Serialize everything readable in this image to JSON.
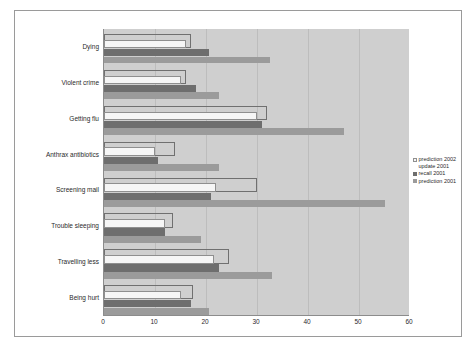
{
  "chart_data": {
    "type": "bar",
    "orientation": "horizontal",
    "title": "",
    "xlabel": "",
    "ylabel": "",
    "xlim": [
      0,
      60
    ],
    "xticks": [
      0,
      10,
      20,
      30,
      40,
      50,
      60
    ],
    "grid": true,
    "legend_position": "right",
    "categories": [
      "Dying",
      "Violent crime",
      "Getting flu",
      "Anthrax antibiotics",
      "Screening mail",
      "Trouble sleeping",
      "Travelling less",
      "Being hurt"
    ],
    "series": [
      {
        "name": "prediction 2002 update 2001",
        "style": "open",
        "color": "#f6f6f6",
        "values": [
          17,
          16,
          32,
          14,
          30,
          13.5,
          24.5,
          17.5
        ]
      },
      {
        "name": "prediction 2002 update 2001 filled",
        "style": "filled-white",
        "color": "#f6f6f6",
        "values": [
          16,
          15,
          30,
          10,
          22,
          12,
          21.5,
          15
        ]
      },
      {
        "name": "recall 2001",
        "color": "#6e6e6e",
        "values": [
          20.5,
          18,
          31,
          10.5,
          21,
          12,
          22.5,
          17
        ]
      },
      {
        "name": "prediction 2001",
        "color": "#9b9b9b",
        "values": [
          32.5,
          22.5,
          47,
          22.5,
          55,
          19,
          33,
          20.5
        ]
      }
    ]
  },
  "legend": {
    "entries": [
      {
        "label": "prediction 2002 update 2001",
        "swatch": "c0"
      },
      {
        "label": "recall 2001",
        "swatch": "c1"
      },
      {
        "label": "prediction 2001",
        "swatch": "c2"
      }
    ]
  }
}
